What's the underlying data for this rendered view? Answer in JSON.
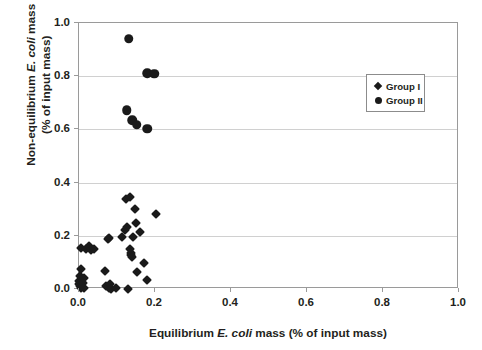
{
  "chart_data": {
    "type": "scatter",
    "title": "",
    "xlabel": "Equilibrium E. coli mass (% of input mass)",
    "ylabel": "Non-equilibrium E. coli mass (% of input mass)",
    "xlabel_parts": {
      "pre": "Equilibrium ",
      "italic": "E. coli",
      "post": " mass (% of input mass)"
    },
    "ylabel_line1_pre": "Non-equilibrium ",
    "ylabel_line1_italic": "E. coli",
    "ylabel_line1_post": " mass",
    "ylabel_line2": "(% of input mass)",
    "xlim": [
      0.0,
      1.0
    ],
    "ylim": [
      0.0,
      1.0
    ],
    "xticks": [
      "0.0",
      "0.2",
      "0.4",
      "0.6",
      "0.8",
      "1.0"
    ],
    "yticks": [
      "0.0",
      "0.2",
      "0.4",
      "0.6",
      "0.8",
      "1.0"
    ],
    "xtick_values": [
      0.0,
      0.2,
      0.4,
      0.6,
      0.8,
      1.0
    ],
    "ytick_values": [
      0.0,
      0.2,
      0.4,
      0.6,
      0.8,
      1.0
    ],
    "grid": "horizontal",
    "legend_position": "upper-right-inset",
    "marker_color": "#1a1a1a",
    "gridline_color": "#d0d0d0",
    "axis_color": "#9a9a9a",
    "series": [
      {
        "name": "Group I",
        "marker": "diamond",
        "points": [
          [
            0.0,
            0.031
          ],
          [
            0.001,
            0.018
          ],
          [
            0.002,
            0.047
          ],
          [
            0.003,
            0.01
          ],
          [
            0.004,
            0.156
          ],
          [
            0.005,
            0.003
          ],
          [
            0.006,
            0.075
          ],
          [
            0.01,
            0.023
          ],
          [
            0.012,
            0.04
          ],
          [
            0.013,
            0.002
          ],
          [
            0.019,
            0.152
          ],
          [
            0.026,
            0.16
          ],
          [
            0.031,
            0.148
          ],
          [
            0.04,
            0.151
          ],
          [
            0.068,
            0.067
          ],
          [
            0.072,
            0.01
          ],
          [
            0.075,
            0.187
          ],
          [
            0.078,
            0.004
          ],
          [
            0.08,
            0.192
          ],
          [
            0.082,
            0.02
          ],
          [
            0.084,
            0.0
          ],
          [
            0.098,
            0.003
          ],
          [
            0.113,
            0.196
          ],
          [
            0.12,
            0.223
          ],
          [
            0.124,
            0.34
          ],
          [
            0.127,
            0.232
          ],
          [
            0.13,
            0.001
          ],
          [
            0.133,
            0.345
          ],
          [
            0.134,
            0.15
          ],
          [
            0.136,
            0.128
          ],
          [
            0.137,
            0.137
          ],
          [
            0.139,
            0.12
          ],
          [
            0.141,
            0.194
          ],
          [
            0.148,
            0.3
          ],
          [
            0.15,
            0.248
          ],
          [
            0.152,
            0.063
          ],
          [
            0.16,
            0.213
          ],
          [
            0.172,
            0.097
          ],
          [
            0.178,
            0.035
          ],
          [
            0.203,
            0.283
          ]
        ]
      },
      {
        "name": "Group II",
        "marker": "circle",
        "points": [
          [
            0.131,
            0.94
          ],
          [
            0.125,
            0.672
          ],
          [
            0.14,
            0.635
          ],
          [
            0.152,
            0.617
          ],
          [
            0.179,
            0.603
          ],
          [
            0.18,
            0.812
          ],
          [
            0.198,
            0.81
          ]
        ]
      }
    ]
  },
  "legend": {
    "items": [
      {
        "label": "Group I",
        "marker": "diamond"
      },
      {
        "label": "Group II",
        "marker": "circle"
      }
    ]
  }
}
